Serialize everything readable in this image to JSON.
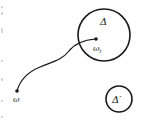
{
  "diagram": {
    "colors": {
      "stroke": "#1a1a1a",
      "background": "#ffffff",
      "edge_marks": "#d8d8d8"
    },
    "regions": [
      {
        "id": "delta",
        "label": "Δ",
        "cx": 104,
        "cy": 35,
        "r": 26
      },
      {
        "id": "delta_prime",
        "label": "Δ′",
        "cx": 119,
        "cy": 99,
        "r": 13
      }
    ],
    "points": [
      {
        "id": "omega",
        "label": "ω",
        "x": 17,
        "y": 91
      },
      {
        "id": "omega_t",
        "label": "ω",
        "subscript": "t",
        "x": 96,
        "y": 39
      }
    ],
    "path": {
      "from": "omega",
      "to": "omega_t"
    }
  }
}
